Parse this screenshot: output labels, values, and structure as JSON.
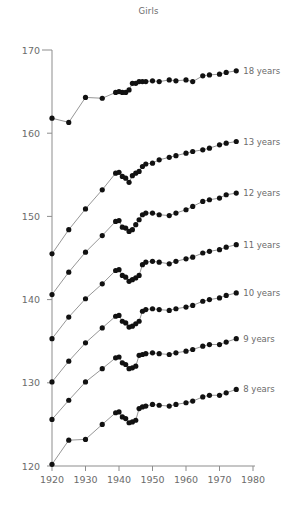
{
  "chart_data": {
    "type": "line",
    "title": "Girls",
    "xlabel": "",
    "ylabel": "",
    "xlim": [
      1916,
      1982
    ],
    "ylim": [
      120,
      170
    ],
    "xticks": [
      1920,
      1930,
      1940,
      1950,
      1960,
      1970,
      1980
    ],
    "yticks": [
      120,
      130,
      140,
      150,
      160,
      170
    ],
    "grid": false,
    "legend_position": "right-inline",
    "x": [
      1920,
      1925,
      1930,
      1935,
      1939,
      1940,
      1941,
      1942,
      1943,
      1944,
      1945,
      1946,
      1947,
      1948,
      1950,
      1952,
      1955,
      1957,
      1960,
      1962,
      1965,
      1967,
      1970,
      1972,
      1975
    ],
    "series": [
      {
        "name": "18 years",
        "label": "18 years",
        "values": [
          161.8,
          161.3,
          164.3,
          164.2,
          164.9,
          165.0,
          164.9,
          164.9,
          165.2,
          166.0,
          166.0,
          166.2,
          166.2,
          166.2,
          166.3,
          166.2,
          166.4,
          166.3,
          166.4,
          166.2,
          166.9,
          167.0,
          167.1,
          167.3,
          167.5
        ]
      },
      {
        "name": "13 years",
        "label": "13 years",
        "values": [
          145.5,
          148.4,
          150.9,
          153.2,
          155.2,
          155.3,
          154.8,
          154.6,
          154.1,
          154.9,
          155.2,
          155.4,
          156.0,
          156.3,
          156.4,
          156.8,
          157.1,
          157.3,
          157.6,
          157.8,
          158.0,
          158.2,
          158.6,
          158.8,
          159.0
        ]
      },
      {
        "name": "12 years",
        "label": "12 years",
        "values": [
          140.6,
          143.3,
          145.7,
          147.7,
          149.4,
          149.5,
          148.7,
          148.6,
          148.2,
          148.4,
          149.0,
          149.6,
          150.2,
          150.4,
          150.4,
          150.2,
          150.1,
          150.4,
          150.8,
          151.2,
          151.8,
          152.0,
          152.2,
          152.6,
          152.8
        ]
      },
      {
        "name": "11 years",
        "label": "11 years",
        "values": [
          135.3,
          137.9,
          140.1,
          141.9,
          143.5,
          143.6,
          142.9,
          142.7,
          142.2,
          142.4,
          142.6,
          142.9,
          144.2,
          144.5,
          144.6,
          144.5,
          144.3,
          144.6,
          144.9,
          145.1,
          145.6,
          145.8,
          146.0,
          146.3,
          146.6
        ]
      },
      {
        "name": "10 years",
        "label": "10 years",
        "values": [
          130.1,
          132.6,
          134.8,
          136.6,
          138.0,
          138.1,
          137.4,
          137.2,
          136.7,
          136.8,
          137.1,
          137.4,
          138.6,
          138.8,
          138.9,
          138.8,
          138.7,
          138.9,
          139.1,
          139.3,
          139.8,
          140.0,
          140.2,
          140.5,
          140.8
        ]
      },
      {
        "name": "9 years",
        "label": "9 years",
        "values": [
          125.6,
          127.9,
          130.1,
          131.7,
          133.0,
          133.1,
          132.4,
          132.2,
          131.7,
          131.8,
          132.0,
          133.3,
          133.4,
          133.5,
          133.6,
          133.5,
          133.4,
          133.6,
          133.8,
          134.0,
          134.4,
          134.6,
          134.6,
          134.9,
          135.3
        ]
      },
      {
        "name": "8 years",
        "label": "8 years",
        "values": [
          120.2,
          123.1,
          123.2,
          125.0,
          126.4,
          126.5,
          125.9,
          125.7,
          125.2,
          125.3,
          125.5,
          126.9,
          127.1,
          127.2,
          127.4,
          127.3,
          127.2,
          127.4,
          127.6,
          127.8,
          128.3,
          128.5,
          128.5,
          128.8,
          129.2
        ]
      }
    ]
  }
}
